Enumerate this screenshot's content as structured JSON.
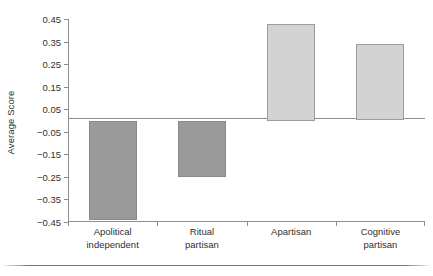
{
  "chart_data": {
    "type": "bar",
    "title": "",
    "subtitle": "",
    "xlabel": "",
    "ylabel": "Average Score",
    "categories": [
      "Apolitical independent",
      "Ritual partisan",
      "Apartisan",
      "Cognitive partisan"
    ],
    "category_lines": [
      [
        "Apolitical",
        "independent"
      ],
      [
        "Ritual",
        "partisan"
      ],
      [
        "Apartisan",
        ""
      ],
      [
        "Cognitive",
        "partisan"
      ]
    ],
    "values": [
      -0.44,
      -0.25,
      0.43,
      0.34
    ],
    "series": [
      {
        "name": "Average Score",
        "values": [
          -0.44,
          -0.25,
          0.43,
          0.34
        ]
      }
    ],
    "ylim": [
      -0.45,
      0.45
    ],
    "ytick_values": [
      0.45,
      0.35,
      0.25,
      0.15,
      0.05,
      -0.05,
      -0.15,
      -0.25,
      -0.35,
      -0.45
    ],
    "ytick_labels": [
      "0.45",
      "0.35",
      "0.25",
      "0.15",
      "0.05",
      "−0.05",
      "−0.15",
      "−0.25",
      "−0.35",
      "−0.45"
    ],
    "grid": false,
    "legend": false,
    "legend_position": "none",
    "zero_line": true,
    "colors": {
      "negative_bar_fill": "#9a9a9a",
      "negative_bar_border": "#8a8a8a",
      "positive_bar_fill": "#d3d3d3",
      "positive_bar_border": "#9c9c9c",
      "axis": "#8d8d8d",
      "text": "#2f2f2f",
      "background": "#ffffff"
    }
  }
}
